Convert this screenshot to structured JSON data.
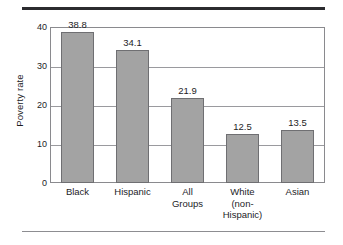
{
  "chart_data": {
    "type": "bar",
    "title": "",
    "xlabel": "",
    "ylabel": "Poverty rate",
    "categories": [
      "Black",
      "Hispanic",
      "All Groups",
      "White (non-Hispanic)",
      "Asian"
    ],
    "category_lines": [
      [
        "Black"
      ],
      [
        "Hispanic"
      ],
      [
        "All",
        "Groups"
      ],
      [
        "White",
        "(non-",
        "Hispanic)"
      ],
      [
        "Asian"
      ]
    ],
    "values": [
      38.8,
      34.1,
      21.9,
      12.5,
      13.5
    ],
    "value_labels": [
      "38.8",
      "34.1",
      "21.9",
      "12.5",
      "13.5"
    ],
    "ylim": [
      0,
      40
    ],
    "yticks": [
      0,
      10,
      20,
      30,
      40
    ],
    "ytick_labels": [
      "0",
      "10",
      "20",
      "30",
      "40"
    ],
    "grid": true,
    "legend": false,
    "legend_position": "none"
  },
  "style": {
    "bar_fill": "#a3a3a3",
    "bar_border": "#6f6f72",
    "grid_color": "#9a9a9e",
    "frame_color": "#8a8a8e",
    "text_color": "#1d1d1f",
    "rule_top_color": "#2b2b2f",
    "rule_bottom_color": "#8d8d91"
  }
}
